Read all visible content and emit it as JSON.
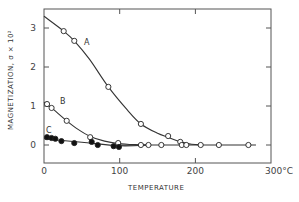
{
  "chart_data": {
    "type": "line",
    "title": "",
    "xlabel": "TEMPERATURE",
    "ylabel": "MAGNETIZATION, σ × 10²",
    "x_unit": "°C",
    "xlim": [
      0,
      300
    ],
    "ylim": [
      -0.45,
      3.5
    ],
    "x_ticks": [
      0,
      100,
      200,
      300
    ],
    "x_tick_labels": [
      "0",
      "100",
      "200",
      "300°C"
    ],
    "y_ticks": [
      0,
      1,
      2,
      3
    ],
    "y_tick_labels": [
      "0",
      "1",
      "2",
      "3"
    ],
    "grid": false,
    "legend": "inline curve labels A, B, C",
    "series": [
      {
        "name": "A",
        "marker": "open-circle",
        "points": [
          [
            26,
            2.92
          ],
          [
            40,
            2.67
          ],
          [
            85,
            1.49
          ],
          [
            128,
            0.54
          ],
          [
            164,
            0.23
          ],
          [
            180,
            0.08
          ]
        ],
        "curve": [
          [
            0,
            3.3
          ],
          [
            26,
            2.92
          ],
          [
            40,
            2.67
          ],
          [
            60,
            2.2
          ],
          [
            85,
            1.49
          ],
          [
            110,
            0.9
          ],
          [
            128,
            0.54
          ],
          [
            150,
            0.3
          ],
          [
            164,
            0.2
          ],
          [
            180,
            0.08
          ],
          [
            195,
            0.02
          ],
          [
            210,
            0.0
          ]
        ]
      },
      {
        "name": "B",
        "marker": "open-circle",
        "points": [
          [
            4,
            1.05
          ],
          [
            10,
            0.95
          ],
          [
            30,
            0.62
          ],
          [
            61,
            0.2
          ],
          [
            98,
            0.05
          ]
        ],
        "curve": [
          [
            0,
            1.1
          ],
          [
            10,
            0.95
          ],
          [
            30,
            0.62
          ],
          [
            45,
            0.4
          ],
          [
            61,
            0.22
          ],
          [
            80,
            0.1
          ],
          [
            98,
            0.04
          ],
          [
            120,
            0.01
          ],
          [
            140,
            0.0
          ]
        ]
      },
      {
        "name": "C",
        "marker": "filled-circle",
        "points": [
          [
            4,
            0.2
          ],
          [
            10,
            0.18
          ],
          [
            15,
            0.16
          ],
          [
            23,
            0.1
          ],
          [
            40,
            0.05
          ],
          [
            63,
            0.08
          ],
          [
            71,
            0.0
          ],
          [
            92,
            -0.03
          ],
          [
            99,
            -0.05
          ]
        ],
        "curve": [
          [
            0,
            0.16
          ],
          [
            50,
            0.07
          ],
          [
            100,
            -0.02
          ],
          [
            140,
            0.0
          ]
        ]
      },
      {
        "name": "baseline",
        "marker": "open-circle",
        "points": [
          [
            128,
            0.0
          ],
          [
            138,
            0.0
          ],
          [
            155,
            0.0
          ],
          [
            182,
            0.0
          ],
          [
            188,
            0.0
          ],
          [
            207,
            0.0
          ],
          [
            231,
            0.0
          ],
          [
            270,
            0.0
          ]
        ],
        "curve": [
          [
            100,
            0.0
          ],
          [
            280,
            0.0
          ]
        ]
      }
    ]
  },
  "labels": {
    "curve_a": "A",
    "curve_b": "B",
    "curve_c": "C",
    "x_title": "TEMPERATURE",
    "y_title": "MAGNETIZATION, σ × 10²"
  }
}
